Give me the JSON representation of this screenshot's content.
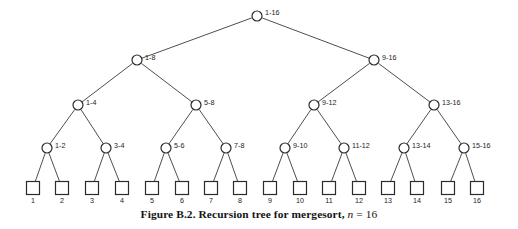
{
  "figure": {
    "caption_label": "Figure B.2.",
    "caption_text": "Recursion tree for mergesort,",
    "caption_math_var": "n",
    "caption_math_rel": "= 16",
    "width": 518,
    "height": 229,
    "background_color": "#ffffff",
    "stroke_color": "#2b2b2b",
    "edge_color": "#3a3a3a",
    "label_color": "#1c1c1c"
  },
  "chart_data": {
    "type": "diagram",
    "title": "Recursion tree for mergesort, n = 16",
    "levels": 5,
    "n": 16,
    "nodes": [
      {
        "id": "n1-16",
        "label": "1-16",
        "level": 0,
        "shape": "circle",
        "cx": 257,
        "cy": 16,
        "label_x": 265,
        "label_y": 13
      },
      {
        "id": "n1-8",
        "label": "1-8",
        "level": 1,
        "shape": "circle",
        "cx": 137,
        "cy": 60,
        "label_x": 145,
        "label_y": 58
      },
      {
        "id": "n9-16",
        "label": "9-16",
        "level": 1,
        "shape": "circle",
        "cx": 374,
        "cy": 60,
        "label_x": 382,
        "label_y": 58
      },
      {
        "id": "n1-4",
        "label": "1-4",
        "level": 2,
        "shape": "circle",
        "cx": 78,
        "cy": 105,
        "label_x": 86,
        "label_y": 103
      },
      {
        "id": "n5-8",
        "label": "5-8",
        "level": 2,
        "shape": "circle",
        "cx": 196,
        "cy": 105,
        "label_x": 204,
        "label_y": 103
      },
      {
        "id": "n9-12",
        "label": "9-12",
        "level": 2,
        "shape": "circle",
        "cx": 314,
        "cy": 105,
        "label_x": 322,
        "label_y": 103
      },
      {
        "id": "n13-16",
        "label": "13-16",
        "level": 2,
        "shape": "circle",
        "cx": 434,
        "cy": 105,
        "label_x": 442,
        "label_y": 103
      },
      {
        "id": "n1-2",
        "label": "1-2",
        "level": 3,
        "shape": "circle",
        "cx": 47,
        "cy": 148,
        "label_x": 55,
        "label_y": 146
      },
      {
        "id": "n3-4",
        "label": "3-4",
        "level": 3,
        "shape": "circle",
        "cx": 106,
        "cy": 148,
        "label_x": 114,
        "label_y": 146
      },
      {
        "id": "n5-6",
        "label": "5-6",
        "level": 3,
        "shape": "circle",
        "cx": 166,
        "cy": 148,
        "label_x": 174,
        "label_y": 146
      },
      {
        "id": "n7-8",
        "label": "7-8",
        "level": 3,
        "shape": "circle",
        "cx": 226,
        "cy": 148,
        "label_x": 234,
        "label_y": 146
      },
      {
        "id": "n9-10",
        "label": "9-10",
        "level": 3,
        "shape": "circle",
        "cx": 285,
        "cy": 148,
        "label_x": 293,
        "label_y": 146
      },
      {
        "id": "n11-12",
        "label": "11-12",
        "level": 3,
        "shape": "circle",
        "cx": 344,
        "cy": 148,
        "label_x": 352,
        "label_y": 146
      },
      {
        "id": "n13-14",
        "label": "13-14",
        "level": 3,
        "shape": "circle",
        "cx": 404,
        "cy": 148,
        "label_x": 412,
        "label_y": 146
      },
      {
        "id": "n15-16",
        "label": "15-16",
        "level": 3,
        "shape": "circle",
        "cx": 464,
        "cy": 148,
        "label_x": 472,
        "label_y": 146
      }
    ],
    "leaves": [
      {
        "id": "leaf1",
        "label": "1",
        "cx": 33,
        "cy": 188
      },
      {
        "id": "leaf2",
        "label": "2",
        "cx": 62,
        "cy": 188
      },
      {
        "id": "leaf3",
        "label": "3",
        "cx": 92,
        "cy": 188
      },
      {
        "id": "leaf4",
        "label": "4",
        "cx": 122,
        "cy": 188
      },
      {
        "id": "leaf5",
        "label": "5",
        "cx": 152,
        "cy": 188
      },
      {
        "id": "leaf6",
        "label": "6",
        "cx": 182,
        "cy": 188
      },
      {
        "id": "leaf7",
        "label": "7",
        "cx": 211,
        "cy": 188
      },
      {
        "id": "leaf8",
        "label": "8",
        "cx": 240,
        "cy": 188
      },
      {
        "id": "leaf9",
        "label": "9",
        "cx": 270,
        "cy": 188
      },
      {
        "id": "leaf10",
        "label": "10",
        "cx": 300,
        "cy": 188
      },
      {
        "id": "leaf11",
        "label": "11",
        "cx": 329,
        "cy": 188
      },
      {
        "id": "leaf12",
        "label": "12",
        "cx": 359,
        "cy": 188
      },
      {
        "id": "leaf13",
        "label": "13",
        "cx": 388,
        "cy": 188
      },
      {
        "id": "leaf14",
        "label": "14",
        "cx": 417,
        "cy": 188
      },
      {
        "id": "leaf15",
        "label": "15",
        "cx": 448,
        "cy": 188
      },
      {
        "id": "leaf16",
        "label": "16",
        "cx": 477,
        "cy": 188
      }
    ],
    "edges": [
      [
        "n1-16",
        "n1-8"
      ],
      [
        "n1-16",
        "n9-16"
      ],
      [
        "n1-8",
        "n1-4"
      ],
      [
        "n1-8",
        "n5-8"
      ],
      [
        "n9-16",
        "n9-12"
      ],
      [
        "n9-16",
        "n13-16"
      ],
      [
        "n1-4",
        "n1-2"
      ],
      [
        "n1-4",
        "n3-4"
      ],
      [
        "n5-8",
        "n5-6"
      ],
      [
        "n5-8",
        "n7-8"
      ],
      [
        "n9-12",
        "n9-10"
      ],
      [
        "n9-12",
        "n11-12"
      ],
      [
        "n13-16",
        "n13-14"
      ],
      [
        "n13-16",
        "n15-16"
      ],
      [
        "n1-2",
        "leaf1"
      ],
      [
        "n1-2",
        "leaf2"
      ],
      [
        "n3-4",
        "leaf3"
      ],
      [
        "n3-4",
        "leaf4"
      ],
      [
        "n5-6",
        "leaf5"
      ],
      [
        "n5-6",
        "leaf6"
      ],
      [
        "n7-8",
        "leaf7"
      ],
      [
        "n7-8",
        "leaf8"
      ],
      [
        "n9-10",
        "leaf9"
      ],
      [
        "n9-10",
        "leaf10"
      ],
      [
        "n11-12",
        "leaf11"
      ],
      [
        "n11-12",
        "leaf12"
      ],
      [
        "n13-14",
        "leaf13"
      ],
      [
        "n13-14",
        "leaf14"
      ],
      [
        "n15-16",
        "leaf15"
      ],
      [
        "n15-16",
        "leaf16"
      ]
    ],
    "geometry": {
      "node_radius": 5,
      "leaf_box_size": 13,
      "leaf_label_dy": 15
    }
  }
}
